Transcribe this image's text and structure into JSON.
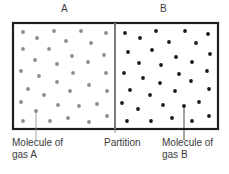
{
  "diagram": {
    "title_left": "A",
    "title_right": "B",
    "labels": {
      "gas_a_line1": "Molecule of",
      "gas_a_line2": "gas A",
      "partition": "Partition",
      "gas_b_line1": "Molecule of",
      "gas_b_line2": "gas B"
    },
    "colors": {
      "border": "#1e1e1e",
      "partition": "#7a7a7a",
      "gas_a": "#8c8c8c",
      "gas_b": "#1a1a1a",
      "text": "#3a3a3a"
    },
    "box": {
      "x": 13,
      "y": 23,
      "width": 205,
      "height": 106,
      "partition_x": 115
    },
    "gas_a_molecules": [
      [
        23,
        32
      ],
      [
        54,
        31
      ],
      [
        81,
        31
      ],
      [
        106,
        33
      ],
      [
        37,
        38
      ],
      [
        66,
        41
      ],
      [
        91,
        43
      ],
      [
        23,
        49
      ],
      [
        49,
        49
      ],
      [
        72,
        56
      ],
      [
        104,
        55
      ],
      [
        35,
        60
      ],
      [
        57,
        64
      ],
      [
        88,
        62
      ],
      [
        21,
        71
      ],
      [
        39,
        76
      ],
      [
        73,
        73
      ],
      [
        106,
        73
      ],
      [
        57,
        82
      ],
      [
        28,
        89
      ],
      [
        70,
        91
      ],
      [
        89,
        85
      ],
      [
        44,
        95
      ],
      [
        107,
        91
      ],
      [
        21,
        102
      ],
      [
        58,
        105
      ],
      [
        79,
        106
      ],
      [
        97,
        104
      ],
      [
        36,
        111
      ],
      [
        23,
        121
      ],
      [
        50,
        121
      ],
      [
        68,
        118
      ],
      [
        89,
        122
      ],
      [
        107,
        116
      ]
    ],
    "gas_b_molecules": [
      [
        125,
        33
      ],
      [
        156,
        31
      ],
      [
        185,
        31
      ],
      [
        208,
        34
      ],
      [
        140,
        38
      ],
      [
        169,
        42
      ],
      [
        196,
        43
      ],
      [
        128,
        52
      ],
      [
        152,
        50
      ],
      [
        176,
        57
      ],
      [
        210,
        54
      ],
      [
        139,
        63
      ],
      [
        161,
        65
      ],
      [
        192,
        62
      ],
      [
        124,
        73
      ],
      [
        143,
        78
      ],
      [
        179,
        74
      ],
      [
        207,
        71
      ],
      [
        160,
        83
      ],
      [
        191,
        81
      ],
      [
        130,
        90
      ],
      [
        175,
        91
      ],
      [
        209,
        89
      ],
      [
        150,
        95
      ],
      [
        122,
        103
      ],
      [
        163,
        105
      ],
      [
        199,
        102
      ],
      [
        138,
        109
      ],
      [
        184,
        106
      ],
      [
        127,
        121
      ],
      [
        151,
        121
      ],
      [
        172,
        118
      ],
      [
        192,
        121
      ],
      [
        209,
        116
      ]
    ],
    "pointer_a": {
      "x": 36,
      "y1": 111,
      "y2": 140
    },
    "pointer_b": {
      "x": 184,
      "y1": 106,
      "y2": 140
    }
  }
}
